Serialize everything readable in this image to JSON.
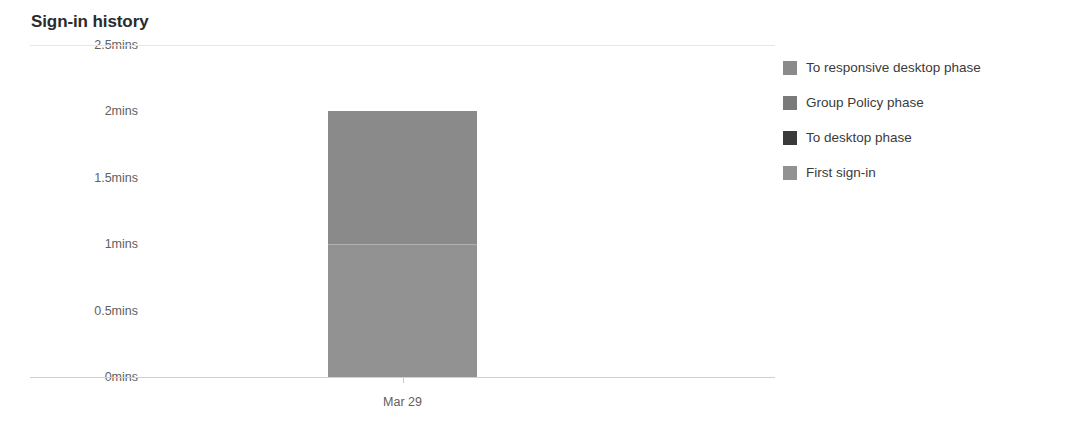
{
  "card": {
    "title": "Sign-in history"
  },
  "chart_data": {
    "type": "bar",
    "title": "Sign-in history",
    "xlabel": "",
    "ylabel": "",
    "categories": [
      "Mar 29"
    ],
    "x": [
      "Mar 29"
    ],
    "ylim": [
      0,
      2.5
    ],
    "y_unit": "mins",
    "y_ticks": [
      2.5,
      2,
      1.5,
      1,
      0.5,
      0
    ],
    "y_tick_labels": [
      "2.5mins",
      "2mins",
      "1.5mins",
      "1mins",
      "0.5mins",
      "0mins"
    ],
    "grid": false,
    "stacked": true,
    "legend_position": "right",
    "series": [
      {
        "name": "To responsive desktop phase",
        "color": "#8a8a8a",
        "values": [
          1.0
        ]
      },
      {
        "name": "Group Policy phase",
        "color": "#7a7a7a",
        "values": [
          0.0
        ]
      },
      {
        "name": "To desktop phase",
        "color": "#3a3a3a",
        "values": [
          0.0
        ]
      },
      {
        "name": "First sign-in",
        "color": "#929292",
        "values": [
          1.0
        ]
      }
    ],
    "bar_total_values": [
      2.0
    ],
    "annotations": []
  },
  "legend": {
    "items": [
      {
        "label": "To responsive desktop phase",
        "color": "#8a8a8a"
      },
      {
        "label": "Group Policy phase",
        "color": "#7a7a7a"
      },
      {
        "label": "To desktop phase",
        "color": "#3a3a3a"
      },
      {
        "label": "First sign-in",
        "color": "#929292"
      }
    ]
  },
  "axis": {
    "y_labels": [
      "2.5mins",
      "2mins",
      "1.5mins",
      "1mins",
      "0.5mins",
      "0mins"
    ],
    "x_labels": [
      "Mar 29"
    ]
  },
  "colors": {
    "axis_line": "#d0d0d0",
    "gridline": "#e6e6e6",
    "tick_text": "#616161",
    "title_text": "#2b2b2b",
    "bar_fill": "#767676"
  }
}
